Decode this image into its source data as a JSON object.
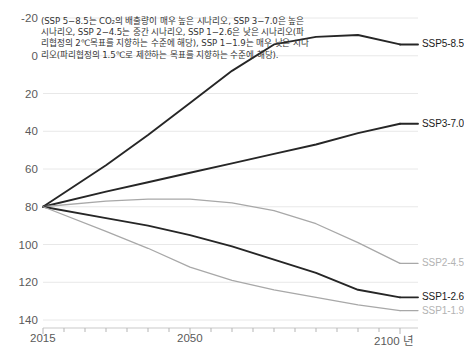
{
  "annotation": {
    "text": "(SSP 5−8.5는 CO₂의 배출량이 매우 높은 시나리오, SSP 3−7.0은 높은 시나리오, SSP 2−4.5는 중간 시나리오, SSP 1−2.6은 낮은 시나리오(파리협정의 2℃목표를 지향하는 수준에 해당), SSP 1−1.9는 매우 낮은 시나리오(파리협정의 1.5℃로 제한하는 목표를 지향하는 수준에 해당)."
  },
  "axis": {
    "y_ticks": [
      "140",
      "120",
      "100",
      "80",
      "60",
      "40",
      "20",
      "0",
      "-20"
    ],
    "x_ticks": [
      "2015",
      "2050",
      "2100 년"
    ]
  },
  "colors": {
    "dark_line": "#262626",
    "gray_line": "#a8a8a8",
    "grid": "#e8e8e8",
    "axis_text": "#5a5a5a",
    "label_dark": "#1a1a1a",
    "label_gray": "#b3b3b3"
  },
  "chart_data": {
    "type": "line",
    "title": "",
    "xlabel": "년",
    "ylabel": "",
    "xlim": [
      2015,
      2100
    ],
    "ylim": [
      -20,
      140
    ],
    "yticks": [
      -20,
      0,
      20,
      40,
      60,
      80,
      100,
      120,
      140
    ],
    "xticks": [
      2015,
      2050,
      2100
    ],
    "grid": true,
    "legend_position": "right-inline",
    "x": [
      2015,
      2030,
      2040,
      2050,
      2060,
      2070,
      2080,
      2090,
      2100
    ],
    "series": [
      {
        "name": "SSP5-8.5",
        "color": "#262626",
        "label_value": "SSP5-8.5",
        "values": [
          40,
          62,
          78,
          95,
          112,
          126,
          130,
          131,
          126
        ]
      },
      {
        "name": "SSP3-7.0",
        "color": "#262626",
        "label_value": "SSP3-7.0",
        "values": [
          40,
          48,
          53,
          58,
          63,
          68,
          73,
          79,
          84
        ]
      },
      {
        "name": "SSP2-4.5",
        "color": "#a8a8a8",
        "label_value": "SSP2-4.5",
        "values": [
          40,
          43,
          44,
          44,
          42,
          38,
          31,
          21,
          10
        ]
      },
      {
        "name": "SSP1-2.6",
        "color": "#262626",
        "label_value": "SSP1-2.6",
        "values": [
          40,
          34,
          30,
          25,
          19,
          12,
          5,
          -4,
          -8
        ]
      },
      {
        "name": "SSP1-1.9",
        "color": "#a8a8a8",
        "label_value": "SSP1-1.9",
        "values": [
          40,
          27,
          18,
          8,
          1,
          -4,
          -8,
          -12,
          -15
        ]
      }
    ]
  }
}
